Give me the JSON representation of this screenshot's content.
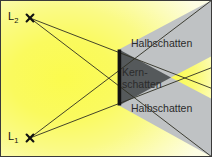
{
  "figure": {
    "width": 212,
    "height": 157
  },
  "sources": [
    {
      "id": "L2",
      "label": "L",
      "sub": "2",
      "marker": "times-marker",
      "x": 30,
      "y": 18
    },
    {
      "id": "L1",
      "label": "L",
      "sub": "1",
      "marker": "times-marker",
      "x": 30,
      "y": 138
    }
  ],
  "object": {
    "name": "occluder-bar",
    "x": 118,
    "y_top": 50,
    "y_bottom": 105,
    "width": 3.5,
    "color": "#111111"
  },
  "regions": {
    "light_label": "Licht",
    "penumbra_label_top": "Halbschatten",
    "penumbra_label_bottom": "Halbschatten",
    "umbra_label_line1": "Kern-",
    "umbra_label_line2": "schatten"
  },
  "colors": {
    "light_core": "#fbfb4e",
    "light_mid": "#f9f97a",
    "light_edge": "#fcfcc4",
    "light_corner": "#fdfde2",
    "penumbra": "#bfc2c4",
    "umbra": "#55595b",
    "ray": "#2f2f22",
    "border": "#3a3a3a",
    "text": "#2b2b2b"
  },
  "geometry": {
    "umbra_apex_x": 171,
    "umbra_apex_y": 77,
    "frame_stroke": 1
  }
}
